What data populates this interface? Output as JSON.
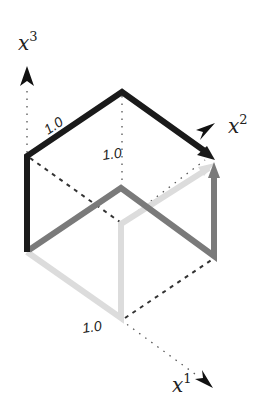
{
  "diagram": {
    "type": "unit-cube-coordinate-axes",
    "axes": [
      {
        "name": "x1",
        "base": "x",
        "superscript": "1"
      },
      {
        "name": "x2",
        "base": "x",
        "superscript": "2"
      },
      {
        "name": "x3",
        "base": "x",
        "superscript": "3"
      }
    ],
    "tick_labels": {
      "x1": "1.0",
      "x2": "1.0",
      "x3": "1.0"
    },
    "colors": {
      "black_path": "#1a1a1a",
      "dark_gray_path": "#7a7a7a",
      "light_gray_path": "#dcdcdc",
      "dotted_axes": "#555555",
      "dashed_edges": "#333333"
    },
    "paths": [
      {
        "name": "black-path",
        "description": "Up x3, along x2 edge to arrowhead at top-right corner"
      },
      {
        "name": "dark-gray-path",
        "description": "Up from origin, across, down, then up to arrowhead"
      },
      {
        "name": "light-gray-path",
        "description": "Along x1 to corner, up, then diagonal to arrowhead"
      }
    ]
  }
}
